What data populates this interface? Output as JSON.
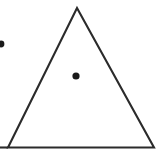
{
  "figure": {
    "title": "Equilateral triangle with interior center point",
    "width": 162,
    "height": 162,
    "background_color": "#ffffff",
    "stroke_color": "#2b2b2b",
    "point_color": "#1a1a1a"
  },
  "chart_data": {
    "type": "scatter",
    "title": "",
    "xlabel": "",
    "ylabel": "",
    "xlim": [
      0,
      162
    ],
    "ylim": [
      0,
      162
    ],
    "grid": false,
    "legend": "none",
    "shapes": [
      {
        "name": "triangle-outline",
        "kind": "polygon",
        "closed": true,
        "fill": "none",
        "stroke": "#2b2b2b",
        "stroke_width": 2.1,
        "vertices": [
          {
            "label": "apex",
            "x": 77,
            "y": 8
          },
          {
            "label": "bottom-right",
            "x": 154,
            "y": 147.5
          },
          {
            "label": "bottom-left",
            "x": 8,
            "y": 147.5
          }
        ]
      },
      {
        "name": "base-extension-line",
        "kind": "line",
        "stroke": "#2b2b2b",
        "stroke_width": 2.1,
        "x1": 0,
        "y1": 147.5,
        "x2": 8,
        "y2": 147.5
      }
    ],
    "points": [
      {
        "name": "center-point",
        "x": 76,
        "y": 76,
        "radius": 3.6,
        "color": "#1a1a1a",
        "marker": "circle-filled",
        "clipped": false
      },
      {
        "name": "left-edge-point",
        "x": 1,
        "y": 44,
        "radius": 3.4,
        "color": "#1a1a1a",
        "marker": "circle-filled",
        "clipped": true
      }
    ],
    "annotations": []
  }
}
